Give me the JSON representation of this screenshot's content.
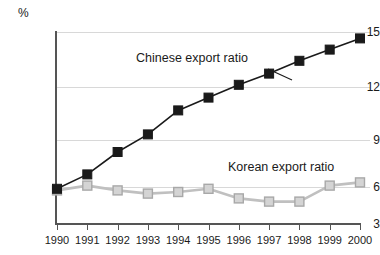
{
  "chart_data": {
    "type": "line",
    "title": "",
    "xlabel": "",
    "ylabel": "%",
    "unit_label": "%",
    "categories": [
      "1990",
      "1991",
      "1992",
      "1993",
      "1994",
      "1995",
      "1996",
      "1997",
      "1998",
      "1999",
      "2000"
    ],
    "x": [
      1990,
      1991,
      1992,
      1993,
      1994,
      1995,
      1996,
      1997,
      1998,
      1999,
      2000
    ],
    "xlim": [
      1990,
      2000
    ],
    "ylim": [
      3,
      15
    ],
    "y_ticks": [
      3,
      6,
      9,
      12,
      15
    ],
    "grid": true,
    "legend_position": "inline-annotation",
    "series": [
      {
        "name": "Chinese export ratio",
        "marker": "filled-square",
        "color": "#1a1a1a",
        "values": [
          5.2,
          6.1,
          7.5,
          8.6,
          10.1,
          10.9,
          11.7,
          12.4,
          13.2,
          13.9,
          14.6
        ]
      },
      {
        "name": "Korean export ratio",
        "marker": "open-square",
        "color": "#c0c0c0",
        "values": [
          5.1,
          5.4,
          5.1,
          4.9,
          5.0,
          5.2,
          4.6,
          4.4,
          4.4,
          5.4,
          5.6
        ]
      }
    ],
    "annotations": [
      {
        "text": "Chinese export ratio",
        "series": "Chinese export ratio"
      },
      {
        "text": "Korean export ratio",
        "series": "Korean export ratio"
      }
    ]
  },
  "axes": {
    "y_tick_labels": [
      "15",
      "12",
      "9",
      "6",
      "3"
    ],
    "x_tick_labels": [
      "1990",
      "1991",
      "1992",
      "1993",
      "1994",
      "1995",
      "1996",
      "1997",
      "1998",
      "1999",
      "2000"
    ]
  },
  "colors": {
    "chinese_series": "#1a1a1a",
    "korean_series": "#c0c0c0",
    "grid": "#d8d8d8",
    "axis": "#555555",
    "background": "#ffffff"
  }
}
